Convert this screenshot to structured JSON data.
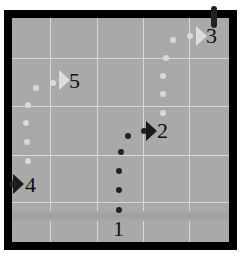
{
  "diagram": {
    "title": "",
    "background_color": "#a9a9a9",
    "frame_color": "#000000",
    "grid_color": "#d8d8d8",
    "grid": {
      "vertical_x": [
        50,
        97,
        143,
        189
      ],
      "horizontal_y": [
        58,
        106,
        155,
        202
      ]
    },
    "waypoints": [
      {
        "id": 1,
        "label": "1",
        "x": 119,
        "y": 229,
        "marker": "none"
      },
      {
        "id": 2,
        "label": "2",
        "x": 152,
        "y": 130,
        "marker": "dark-triangle"
      },
      {
        "id": 3,
        "label": "3",
        "x": 210,
        "y": 36,
        "marker": "light-triangle"
      },
      {
        "id": 4,
        "label": "4",
        "x": 18,
        "y": 184,
        "marker": "dark-triangle"
      },
      {
        "id": 5,
        "label": "5",
        "x": 63,
        "y": 80,
        "marker": "light-triangle"
      }
    ],
    "paths": [
      {
        "name": "path-1-to-2",
        "color": "#222222",
        "dots": [
          [
            119,
            210
          ],
          [
            119,
            190
          ],
          [
            119,
            171
          ],
          [
            121,
            152
          ],
          [
            128,
            136
          ],
          [
            144,
            131
          ]
        ]
      },
      {
        "name": "path-2-to-3",
        "color": "#d9d9d9",
        "dots": [
          [
            163,
            113
          ],
          [
            163,
            94
          ],
          [
            163,
            76
          ],
          [
            166,
            58
          ],
          [
            173,
            40
          ],
          [
            190,
            36
          ]
        ]
      },
      {
        "name": "path-4-to-5",
        "color": "#d9d9d9",
        "dots": [
          [
            28,
            161
          ],
          [
            27,
            142
          ],
          [
            26,
            123
          ],
          [
            28,
            105
          ],
          [
            36,
            88
          ],
          [
            53,
            83
          ]
        ]
      }
    ],
    "edge_markers": [
      {
        "name": "top-marker-3",
        "x": 214,
        "y": 14,
        "color": "#222222"
      },
      {
        "name": "left-marker-4",
        "x": 12,
        "y": 184,
        "color": "#222222"
      }
    ]
  }
}
